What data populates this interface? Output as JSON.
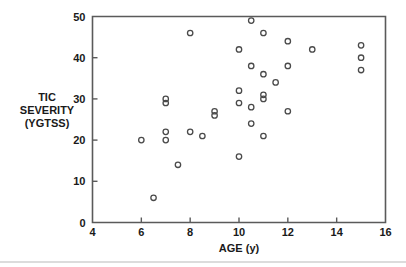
{
  "chart_data": {
    "type": "scatter",
    "title": "",
    "xlabel": "AGE (y)",
    "ylabel": "TIC SEVERITY (YGTSS)",
    "ylabel_lines": [
      "TIC",
      "SEVERITY",
      "(YGTSS)"
    ],
    "xlim": [
      4,
      16
    ],
    "ylim": [
      0,
      50
    ],
    "xticks": [
      4,
      6,
      8,
      10,
      12,
      14,
      16
    ],
    "xtick_labels": [
      "4",
      "6",
      "8",
      "10",
      "12",
      "14",
      "16"
    ],
    "yticks": [
      0,
      10,
      20,
      30,
      40,
      50
    ],
    "ytick_labels": [
      "0",
      "10",
      "20",
      "30",
      "40",
      "50"
    ],
    "grid": false,
    "legend": null,
    "marker": "open-circle",
    "points": [
      {
        "x": 6.0,
        "y": 20
      },
      {
        "x": 6.5,
        "y": 6
      },
      {
        "x": 7.0,
        "y": 30
      },
      {
        "x": 7.0,
        "y": 29
      },
      {
        "x": 7.0,
        "y": 22
      },
      {
        "x": 7.0,
        "y": 20
      },
      {
        "x": 7.5,
        "y": 14
      },
      {
        "x": 8.0,
        "y": 46
      },
      {
        "x": 8.0,
        "y": 22
      },
      {
        "x": 8.5,
        "y": 21
      },
      {
        "x": 9.0,
        "y": 27
      },
      {
        "x": 9.0,
        "y": 26
      },
      {
        "x": 10.0,
        "y": 42
      },
      {
        "x": 10.0,
        "y": 32
      },
      {
        "x": 10.0,
        "y": 29
      },
      {
        "x": 10.0,
        "y": 16
      },
      {
        "x": 10.5,
        "y": 49
      },
      {
        "x": 10.5,
        "y": 38
      },
      {
        "x": 10.5,
        "y": 28
      },
      {
        "x": 10.5,
        "y": 24
      },
      {
        "x": 11.0,
        "y": 46
      },
      {
        "x": 11.0,
        "y": 36
      },
      {
        "x": 11.0,
        "y": 31
      },
      {
        "x": 11.0,
        "y": 30
      },
      {
        "x": 11.0,
        "y": 21
      },
      {
        "x": 11.5,
        "y": 34
      },
      {
        "x": 12.0,
        "y": 44
      },
      {
        "x": 12.0,
        "y": 38
      },
      {
        "x": 12.0,
        "y": 27
      },
      {
        "x": 13.0,
        "y": 42
      },
      {
        "x": 15.0,
        "y": 43
      },
      {
        "x": 15.0,
        "y": 40
      },
      {
        "x": 15.0,
        "y": 37
      }
    ]
  }
}
